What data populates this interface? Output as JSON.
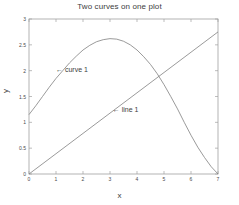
{
  "chart_data": {
    "type": "line",
    "title": "Two curves on one plot",
    "xlabel": "x",
    "ylabel": "y",
    "xlim": [
      0,
      7
    ],
    "ylim": [
      0,
      3
    ],
    "grid": false,
    "legend_position": "none",
    "xticks": [
      "0",
      "1",
      "2",
      "3",
      "4",
      "5",
      "6",
      "7"
    ],
    "xtick_values": [
      0,
      1,
      2,
      3,
      4,
      5,
      6,
      7
    ],
    "yticks": [
      "0",
      "0.5",
      "1",
      "1.5",
      "2",
      "2.5",
      "3"
    ],
    "ytick_values": [
      0,
      0.5,
      1,
      1.5,
      2,
      2.5,
      3
    ],
    "series": [
      {
        "name": "curve 1",
        "type": "line",
        "color": "#808080",
        "x": [
          0,
          0.25,
          0.5,
          0.75,
          1,
          1.25,
          1.5,
          1.75,
          2,
          2.25,
          2.5,
          2.75,
          3,
          3.25,
          3.5,
          3.75,
          4,
          4.25,
          4.5,
          4.75,
          5,
          5.25,
          5.5,
          5.75,
          6,
          6.25,
          6.5,
          6.75,
          7
        ],
        "values": [
          1.15,
          1.32,
          1.5,
          1.68,
          1.85,
          2.0,
          2.15,
          2.28,
          2.4,
          2.49,
          2.56,
          2.6,
          2.62,
          2.61,
          2.57,
          2.5,
          2.4,
          2.27,
          2.12,
          1.94,
          1.73,
          1.5,
          1.26,
          1.0,
          0.75,
          0.52,
          0.32,
          0.14,
          0.0
        ]
      },
      {
        "name": "line 1",
        "type": "line",
        "color": "#808080",
        "x": [
          0,
          7
        ],
        "values": [
          0,
          2.75
        ]
      }
    ],
    "annotations": [
      {
        "label": "curve 1",
        "text": "← curve 1",
        "arrow": "left-arrow",
        "x": 1.0,
        "y": 2.0
      },
      {
        "label": "line 1",
        "text": "← line 1",
        "arrow": "left-arrow",
        "x": 3.1,
        "y": 1.22
      }
    ],
    "colors": {
      "background": "#ffffff",
      "axis": "#a0a0a0",
      "curve": "#808080",
      "text": "#3d3d3d"
    }
  }
}
